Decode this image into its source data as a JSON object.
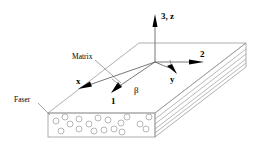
{
  "diagram": {
    "type": "composite-laminate-coordinate-system",
    "labels": {
      "axis_3z": "3, z",
      "axis_2": "2",
      "axis_1": "1",
      "axis_x": "x",
      "axis_y": "y",
      "angle": "β",
      "matrix": "Matrix",
      "fiber": "Faser"
    },
    "colors": {
      "line": "#9a9a9a",
      "arrow": "#000000",
      "background": "#ffffff"
    }
  }
}
